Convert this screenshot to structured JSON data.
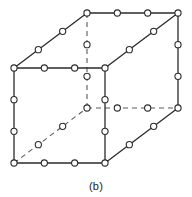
{
  "figure": {
    "caption": "(b)",
    "kind": "cube-lattice-diagram",
    "projection": "oblique",
    "canvas": {
      "width": 192,
      "height": 197
    },
    "colors": {
      "background": "#ffffff",
      "solid_edge": "#2b2b2b",
      "hidden_edge": "#5a5a5a",
      "atom_fill": "#ffffff",
      "atom_stroke": "#2b2b2b",
      "caption_text": "#1d1d1d"
    },
    "style": {
      "solid_edge_width": 1.3,
      "hidden_edge_width": 1.1,
      "hidden_dash_pattern": "5 4",
      "atom_radius": 3.1,
      "atoms_per_edge_interior": 2
    },
    "vertices": [
      {
        "id": "front-top-left",
        "x": 14,
        "y": 68,
        "hidden": false
      },
      {
        "id": "front-top-right",
        "x": 105,
        "y": 68,
        "hidden": false
      },
      {
        "id": "front-bottom-right",
        "x": 105,
        "y": 163,
        "hidden": false
      },
      {
        "id": "front-bottom-left",
        "x": 14,
        "y": 163,
        "hidden": false
      },
      {
        "id": "back-top-left",
        "x": 87,
        "y": 13,
        "hidden": false
      },
      {
        "id": "back-top-right",
        "x": 178,
        "y": 13,
        "hidden": false
      },
      {
        "id": "back-bottom-right",
        "x": 178,
        "y": 108,
        "hidden": false
      },
      {
        "id": "back-bottom-left",
        "x": 87,
        "y": 108,
        "hidden": true
      }
    ],
    "edges": [
      {
        "id": "front-top",
        "from": "front-top-left",
        "to": "front-top-right",
        "hidden": false
      },
      {
        "id": "front-right",
        "from": "front-top-right",
        "to": "front-bottom-right",
        "hidden": false
      },
      {
        "id": "front-bottom",
        "from": "front-bottom-left",
        "to": "front-bottom-right",
        "hidden": false
      },
      {
        "id": "front-left",
        "from": "front-top-left",
        "to": "front-bottom-left",
        "hidden": false
      },
      {
        "id": "back-top",
        "from": "back-top-left",
        "to": "back-top-right",
        "hidden": false
      },
      {
        "id": "back-right",
        "from": "back-top-right",
        "to": "back-bottom-right",
        "hidden": false
      },
      {
        "id": "back-bottom",
        "from": "back-bottom-left",
        "to": "back-bottom-right",
        "hidden": true
      },
      {
        "id": "back-left",
        "from": "back-top-left",
        "to": "back-bottom-left",
        "hidden": true
      },
      {
        "id": "connect-top-left",
        "from": "front-top-left",
        "to": "back-top-left",
        "hidden": false
      },
      {
        "id": "connect-top-right",
        "from": "front-top-right",
        "to": "back-top-right",
        "hidden": false
      },
      {
        "id": "connect-bottom-right",
        "from": "front-bottom-right",
        "to": "back-bottom-right",
        "hidden": false
      },
      {
        "id": "connect-bottom-left",
        "from": "front-bottom-left",
        "to": "back-bottom-left",
        "hidden": true
      }
    ]
  }
}
